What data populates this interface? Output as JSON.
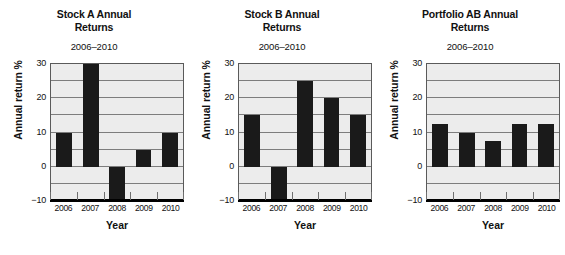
{
  "chart_data": [
    {
      "type": "bar",
      "title": "Stock A Annual Returns",
      "subtitle": "2006–2010",
      "xlabel": "Year",
      "ylabel": "Annual return %",
      "categories": [
        "2006",
        "2007",
        "2008",
        "2009",
        "2010"
      ],
      "values": [
        10,
        30,
        -10,
        5,
        10
      ],
      "ylim": [
        -10,
        30
      ],
      "yticks": [
        30,
        20,
        10,
        0,
        -10
      ],
      "ytick_labels": [
        "30",
        "20",
        "10",
        "0",
        "−10"
      ],
      "gridlines": [
        25,
        20,
        15,
        10,
        5,
        0,
        -5
      ],
      "grid": true,
      "legend": "none",
      "bar_color": "#1a1a1a",
      "plot_bg": "#ececec"
    },
    {
      "type": "bar",
      "title": "Stock B Annual Returns",
      "subtitle": "2006–2010",
      "xlabel": "Year",
      "ylabel": "Annual return %",
      "categories": [
        "2006",
        "2007",
        "2008",
        "2009",
        "2010"
      ],
      "values": [
        15,
        -10,
        25,
        20,
        15
      ],
      "ylim": [
        -10,
        30
      ],
      "yticks": [
        30,
        20,
        10,
        0,
        -10
      ],
      "ytick_labels": [
        "30",
        "20",
        "10",
        "0",
        "−10"
      ],
      "gridlines": [
        25,
        20,
        15,
        10,
        5,
        0,
        -5
      ],
      "grid": true,
      "legend": "none",
      "bar_color": "#1a1a1a",
      "plot_bg": "#ececec"
    },
    {
      "type": "bar",
      "title": "Portfolio AB Annual Returns",
      "subtitle": "2006–2010",
      "xlabel": "Year",
      "ylabel": "Annual return %",
      "categories": [
        "2006",
        "2007",
        "2008",
        "2009",
        "2010"
      ],
      "values": [
        12.5,
        10,
        7.5,
        12.5,
        12.5
      ],
      "ylim": [
        -10,
        30
      ],
      "yticks": [
        30,
        20,
        10,
        0,
        -10
      ],
      "ytick_labels": [
        "30",
        "20",
        "10",
        "0",
        "−10"
      ],
      "gridlines": [
        25,
        20,
        15,
        10,
        5,
        0,
        -5
      ],
      "grid": true,
      "legend": "none",
      "bar_color": "#1a1a1a",
      "plot_bg": "#ececec"
    }
  ]
}
